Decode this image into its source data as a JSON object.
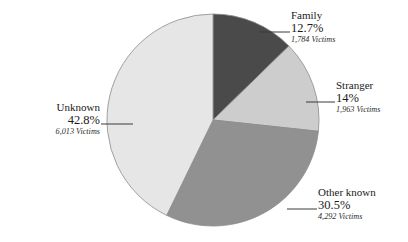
{
  "chart_data": {
    "type": "pie",
    "title": "",
    "subtitle": "",
    "xlabel": "",
    "ylabel": "",
    "legend_position": "none",
    "grid": false,
    "value_unit": "Victims",
    "categories": [
      "Family",
      "Stranger",
      "Other known",
      "Unknown"
    ],
    "values": [
      12.7,
      14,
      30.5,
      42.8
    ],
    "counts": [
      1784,
      1963,
      4292,
      6013
    ],
    "start_angle_deg": 0,
    "direction": "clockwise",
    "slices": [
      {
        "name": "Family",
        "percent_label": "12.7%",
        "percent_value": 12.7,
        "count_label": "1,784 Victims",
        "count_value": 1784,
        "color": "#4a4a4a"
      },
      {
        "name": "Stranger",
        "percent_label": "14%",
        "percent_value": 14,
        "count_label": "1,963 Victims",
        "count_value": 1963,
        "color": "#cdcdcd"
      },
      {
        "name": "Other known",
        "percent_label": "30.5%",
        "percent_value": 30.5,
        "count_label": "4,292 Victims",
        "count_value": 4292,
        "color": "#919191"
      },
      {
        "name": "Unknown",
        "percent_label": "42.8%",
        "percent_value": 42.8,
        "count_label": "6,013 Victims",
        "count_value": 6013,
        "color": "#e6e6e6"
      }
    ],
    "geometry": {
      "center_x": 213,
      "center_y": 120,
      "radius": 106
    },
    "colors": {
      "family": "#4a4a4a",
      "stranger": "#cdcdcd",
      "other_known": "#919191",
      "unknown": "#e6e6e6",
      "outline": "#8c8c8c",
      "leader_line": "#3a3a3a",
      "text": "#1a1a1a",
      "background": "#ffffff"
    }
  }
}
